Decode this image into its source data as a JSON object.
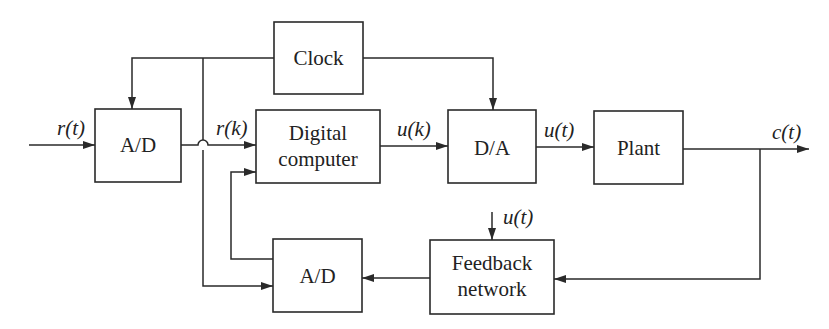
{
  "diagram": {
    "type": "block-diagram",
    "blocks": {
      "clock": {
        "label": "Clock"
      },
      "ad_top": {
        "label": "A/D"
      },
      "digital_computer": {
        "line1": "Digital",
        "line2": "computer"
      },
      "da": {
        "label": "D/A"
      },
      "plant": {
        "label": "Plant"
      },
      "feedback_network": {
        "line1": "Feedback",
        "line2": "network"
      },
      "ad_bottom": {
        "label": "A/D"
      }
    },
    "signals": {
      "input": "r(t)",
      "sampled_reference": "r(k)",
      "computer_output": "u(k)",
      "control_signal": "u(t)",
      "output": "c(t)",
      "feedback_input": "u(t)"
    },
    "colors": {
      "stroke": "#2a2a2a",
      "text": "#222222",
      "background": "#ffffff"
    }
  }
}
